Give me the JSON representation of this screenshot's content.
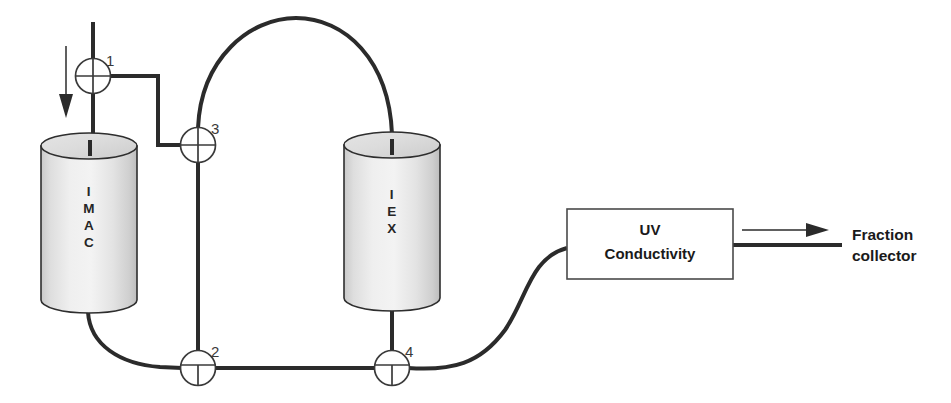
{
  "diagram": {
    "background_color": "#ffffff",
    "line_color": "#2b2b2b",
    "columns": [
      {
        "id": "imac",
        "name": "IMAC column",
        "label": "IMAC",
        "letters": [
          "I",
          "M",
          "A",
          "C"
        ]
      },
      {
        "id": "iex",
        "name": "IEX column",
        "label": "IEX",
        "letters": [
          "I",
          "E",
          "X"
        ]
      }
    ],
    "valves": [
      {
        "id": "valve-1",
        "number": "1",
        "type": "four-way"
      },
      {
        "id": "valve-2",
        "number": "2",
        "type": "tee"
      },
      {
        "id": "valve-3",
        "number": "3",
        "type": "four-way"
      },
      {
        "id": "valve-4",
        "number": "4",
        "type": "tee"
      }
    ],
    "detector": {
      "id": "uv-conductivity-detector",
      "line1": "UV",
      "line2": "Conductivity"
    },
    "outlet": {
      "id": "fraction-collector",
      "line1": "Fraction",
      "line2": "collector"
    },
    "inlet": {
      "id": "sample-inlet",
      "arrow_direction": "down"
    }
  }
}
